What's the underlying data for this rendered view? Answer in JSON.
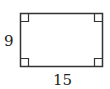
{
  "diagram": {
    "shape": "rectangle",
    "labels": {
      "height": "9",
      "width": "15"
    },
    "right_angle_markers": 4,
    "stroke_color": "#333333"
  }
}
